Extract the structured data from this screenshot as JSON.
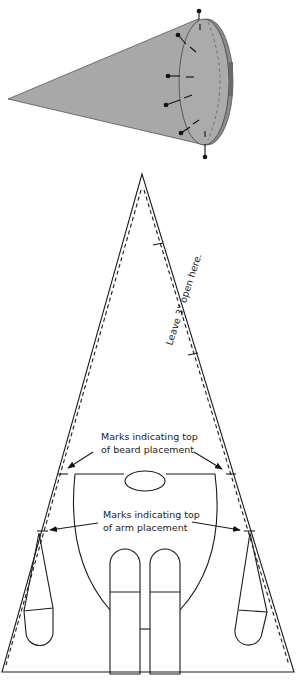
{
  "figure": {
    "cone_illustration": {
      "fill": "#a8a8a8",
      "rim_fill": "#8a8a8a",
      "pins": 7
    },
    "pattern": {
      "annotations": {
        "leave_open": "Leave 3\" open here.",
        "beard_line1": "Marks indicating top",
        "beard_line2": "of beard placement",
        "arm_line1": "Marks indicating top",
        "arm_line2": "of arm placement"
      },
      "stroke": "#1a1a1a"
    }
  }
}
